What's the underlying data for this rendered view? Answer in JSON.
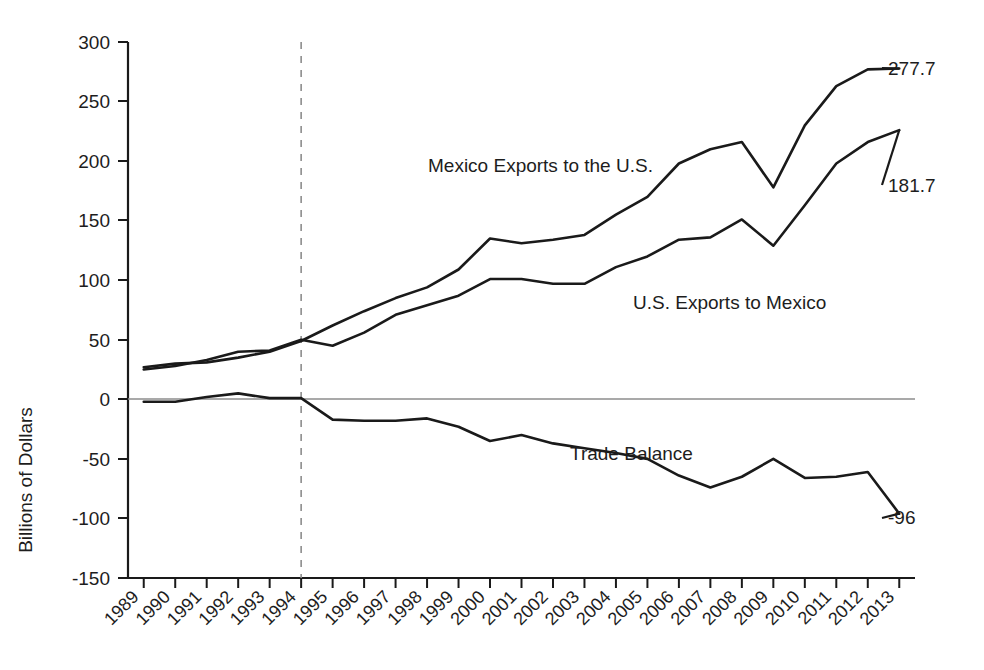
{
  "chart_data": {
    "type": "line",
    "title": "",
    "subtitle": "",
    "xlabel": "",
    "ylabel": "Billions of Dollars",
    "ylim": [
      -150,
      300
    ],
    "xlim": [
      1989,
      2013
    ],
    "yticks": [
      300,
      250,
      200,
      150,
      100,
      50,
      0,
      -50,
      -100,
      -150
    ],
    "ytick_labels": [
      "300",
      "250",
      "200",
      "150",
      "100",
      "50",
      "0",
      "-50",
      "-100",
      "-150"
    ],
    "grid": false,
    "legend_position": "inline-annotations",
    "categories": [
      "1989",
      "1990",
      "1991",
      "1992",
      "1993",
      "1994",
      "1995",
      "1996",
      "1997",
      "1998",
      "1999",
      "2000",
      "2001",
      "2002",
      "2003",
      "2004",
      "2005",
      "2006",
      "2007",
      "2008",
      "2009",
      "2010",
      "2011",
      "2012",
      "2013"
    ],
    "x": [
      1989,
      1990,
      1991,
      1992,
      1993,
      1994,
      1995,
      1996,
      1997,
      1998,
      1999,
      2000,
      2001,
      2002,
      2003,
      2004,
      2005,
      2006,
      2007,
      2008,
      2009,
      2010,
      2011,
      2012,
      2013
    ],
    "series": [
      {
        "name": "Mexico Exports to the U.S.",
        "label": "Mexico Exports to the U.S.",
        "end_value_label": "277.7",
        "values": [
          27,
          30,
          31,
          35,
          40,
          49,
          62,
          74,
          85,
          94,
          109,
          135,
          131,
          134,
          138,
          155,
          170,
          198,
          210,
          216,
          178,
          230,
          263,
          277,
          277.7
        ]
      },
      {
        "name": "U.S. Exports to Mexico",
        "label": "U.S. Exports to Mexico",
        "end_value_label": "181.7",
        "values": [
          25,
          28,
          33,
          40,
          41,
          50,
          45,
          56,
          71,
          79,
          87,
          101,
          101,
          97,
          97,
          111,
          120,
          134,
          136,
          151,
          129,
          163,
          198,
          216,
          226
        ]
      },
      {
        "name": "Trade Balance",
        "label": "Trade Balance",
        "end_value_label": "-96",
        "values": [
          -2,
          -2,
          2,
          5,
          1,
          1,
          -17,
          -18,
          -18,
          -16,
          -23,
          -35,
          -30,
          -37,
          -41,
          -45,
          -50,
          -64,
          -74,
          -65,
          -50,
          -66,
          -65,
          -61,
          -96
        ]
      }
    ],
    "annotations": [
      {
        "name": "nafta-marker",
        "x": 1994,
        "style": "dashed-vertical",
        "label": ""
      }
    ]
  },
  "labels": {
    "y_axis_title": "Billions of Dollars",
    "mexico_exports": "Mexico Exports to the U.S.",
    "us_exports": "U.S. Exports to Mexico",
    "trade_balance": "Trade Balance",
    "mexico_end": "277.7",
    "us_end": "181.7",
    "balance_end": "-96"
  },
  "colors": {
    "line": "#1a1a1a",
    "axis": "#1a1a1a",
    "zero_line": "#8d8d8d",
    "event_line": "#8d8d8d",
    "background": "#ffffff"
  }
}
